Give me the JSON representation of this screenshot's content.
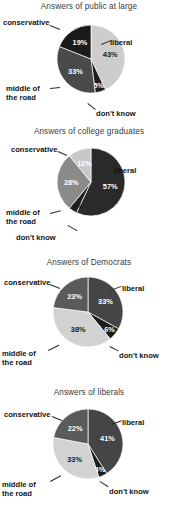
{
  "figure": {
    "background": "#ffffff",
    "palette_note": "grayscale print figure"
  },
  "chart_data": [
    {
      "type": "pie",
      "title": "Answers of public at large",
      "categories": [
        "liberal",
        "don't know",
        "middle of the road",
        "conservative"
      ],
      "values": [
        43,
        5,
        33,
        19
      ],
      "labels": [
        "43%",
        "5%",
        "33%",
        "19%"
      ],
      "colors": [
        "#cdcdcd",
        "#1e1e1e",
        "#4a4a4a",
        "#1a1a1a"
      ],
      "label_text_on_light": [
        true,
        false,
        false,
        false
      ],
      "start_angle_deg": 0,
      "legend_position": "callout-labels"
    },
    {
      "type": "pie",
      "title": "Answers of college graduates",
      "categories": [
        "liberal",
        "don't know",
        "middle of the road",
        "conservative"
      ],
      "values": [
        57,
        4,
        28,
        11
      ],
      "labels": [
        "57%",
        "4%",
        "28%",
        "11%"
      ],
      "colors": [
        "#2a2a2a",
        "#202020",
        "#8a8a8a",
        "#c8c8c8"
      ],
      "label_text_on_light": [
        false,
        true,
        false,
        false
      ],
      "start_angle_deg": 0,
      "legend_position": "callout-labels"
    },
    {
      "type": "pie",
      "title": "Answers of Democrats",
      "categories": [
        "liberal",
        "don't know",
        "middle of the road",
        "conservative"
      ],
      "values": [
        33,
        6,
        38,
        23
      ],
      "labels": [
        "33%",
        "6%",
        "38%",
        "23%"
      ],
      "colors": [
        "#454545",
        "#1c1c1c",
        "#d2d2d2",
        "#5a5a5a"
      ],
      "label_text_on_light": [
        false,
        false,
        true,
        false
      ],
      "start_angle_deg": 0,
      "legend_position": "callout-labels"
    },
    {
      "type": "pie",
      "title": "Answers of liberals",
      "categories": [
        "liberal",
        "don't know",
        "middle of the road",
        "conservative"
      ],
      "values": [
        41,
        4,
        33,
        22
      ],
      "labels": [
        "41%",
        "4%",
        "33%",
        "22%"
      ],
      "colors": [
        "#454545",
        "#1c1c1c",
        "#d2d2d2",
        "#5a5a5a"
      ],
      "label_text_on_light": [
        false,
        false,
        true,
        false
      ],
      "start_angle_deg": 0,
      "legend_position": "callout-labels"
    }
  ],
  "charts": [
    {
      "title": "Answers of public at large",
      "label_liberal": "liberal",
      "label_dont_know": "don't know",
      "label_middle_1": "middle of",
      "label_middle_2": "the road",
      "label_conservative": "conservative",
      "pct_liberal": "43%",
      "pct_dont_know": "5%",
      "pct_middle": "33%",
      "pct_conservative": "19%"
    },
    {
      "title": "Answers of college graduates",
      "label_liberal": "liberal",
      "label_dont_know": "don't know",
      "label_middle_1": "middle of",
      "label_middle_2": "the road",
      "label_conservative": "conservative",
      "pct_liberal": "57%",
      "pct_dont_know": "4%",
      "pct_middle": "28%",
      "pct_conservative": "11%"
    },
    {
      "title": "Answers of Democrats",
      "label_liberal": "liberal",
      "label_dont_know": "don't know",
      "label_middle_1": "middle of",
      "label_middle_2": "the road",
      "label_conservative": "conservative",
      "pct_liberal": "33%",
      "pct_dont_know": "6%",
      "pct_middle": "38%",
      "pct_conservative": "23%"
    },
    {
      "title": "Answers of liberals",
      "label_liberal": "liberal",
      "label_dont_know": "don't know",
      "label_middle_1": "middle of",
      "label_middle_2": "the road",
      "label_conservative": "conservative",
      "pct_liberal": "41%",
      "pct_dont_know": "4%",
      "pct_middle": "33%",
      "pct_conservative": "22%"
    }
  ]
}
